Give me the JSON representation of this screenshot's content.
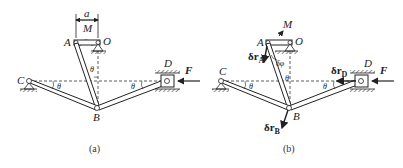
{
  "figure": {
    "panels": [
      {
        "id": "a",
        "caption": "(a)",
        "labels": {
          "A": "A",
          "O": "O",
          "M": "M",
          "a": "a",
          "B": "B",
          "C": "C",
          "D": "D",
          "F": "F",
          "theta1": "θ",
          "theta2": "θ",
          "theta3": "θ"
        }
      },
      {
        "id": "b",
        "caption": "(b)",
        "labels": {
          "A": "A",
          "O": "O",
          "M": "M",
          "B": "B",
          "C": "C",
          "D": "D",
          "F": "F",
          "theta1": "θ",
          "theta2": "θ",
          "theta3": "θ",
          "dphi": "δφ",
          "drA": "δr",
          "drA_sub": "A",
          "drB": "δr",
          "drB_sub": "B",
          "drD": "δr",
          "drD_sub": "D"
        }
      }
    ],
    "colors": {
      "line": "#222222",
      "dash": "#333333",
      "background": "#ffffff"
    }
  }
}
